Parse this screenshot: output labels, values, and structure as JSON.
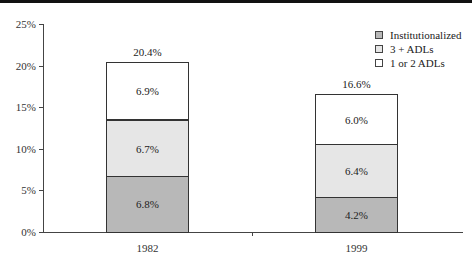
{
  "chart_data": {
    "type": "bar",
    "stacked": true,
    "title": "",
    "xlabel": "",
    "ylabel": "",
    "ylim": [
      0,
      25
    ],
    "y_ticks": [
      "0%",
      "5%",
      "10%",
      "15%",
      "20%",
      "25%"
    ],
    "categories": [
      "1982",
      "1999"
    ],
    "series": [
      {
        "name": "Institutionalized",
        "color": "#b8b8b8",
        "values": [
          6.8,
          4.2
        ],
        "labels": [
          "6.8%",
          "4.2%"
        ]
      },
      {
        "name": "3 + ADLs",
        "color": "#e6e6e6",
        "values": [
          6.7,
          6.4
        ],
        "labels": [
          "6.7%",
          "6.4%"
        ]
      },
      {
        "name": "1 or 2 ADLs",
        "color": "#ffffff",
        "values": [
          6.9,
          6.0
        ],
        "labels": [
          "6.9%",
          "6.0%"
        ]
      }
    ],
    "totals": [
      "20.4%",
      "16.6%"
    ],
    "legend_position": "top-right",
    "grid": false
  },
  "legend": {
    "items": [
      {
        "label": "Institutionalized",
        "color": "#b8b8b8"
      },
      {
        "label": "3 + ADLs",
        "color": "#e6e6e6"
      },
      {
        "label": "1 or 2 ADLs",
        "color": "#ffffff"
      }
    ]
  }
}
